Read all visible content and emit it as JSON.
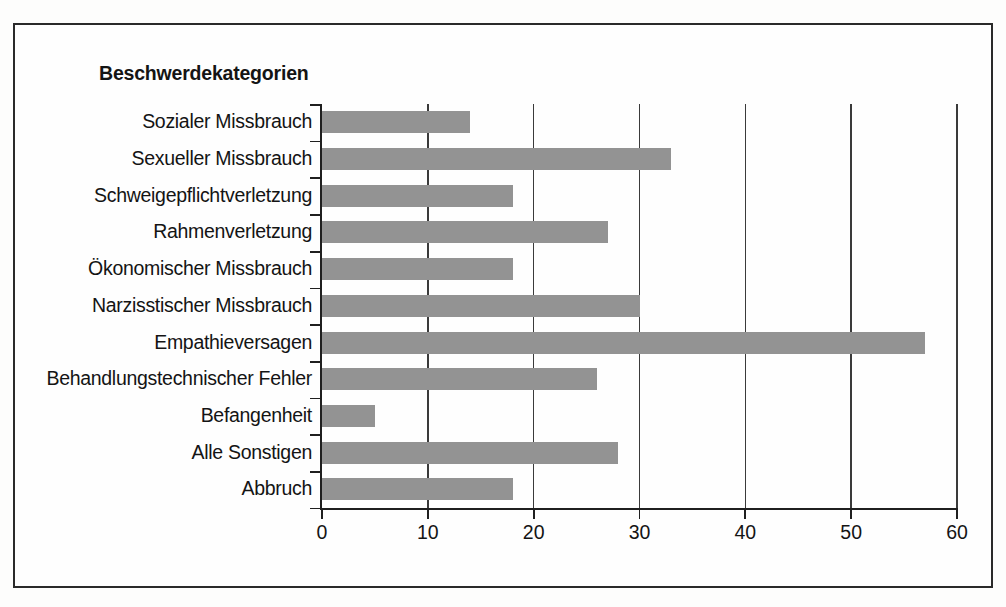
{
  "chart": {
    "title": "Beschwerdekategorien",
    "bar_color": "#939393",
    "frame_color": "#2a2a2a",
    "axis_color": "#1f1f1f"
  },
  "chart_data": {
    "type": "bar",
    "orientation": "horizontal",
    "title": "Beschwerdekategorien",
    "xlabel": "",
    "ylabel": "",
    "xlim": [
      0,
      60
    ],
    "xticks": [
      0,
      10,
      20,
      30,
      40,
      50,
      60
    ],
    "xtick_labels": [
      "0",
      "10",
      "20",
      "30",
      "40",
      "50",
      "60"
    ],
    "grid": true,
    "grid_axis": "x",
    "legend": false,
    "categories": [
      "Sozialer Missbrauch",
      "Sexueller Missbrauch",
      "Schweigepflichtverletzung",
      "Rahmenverletzung",
      "Ökonomischer Missbrauch",
      "Narzisstischer Missbrauch",
      "Empathieversagen",
      "Behandlungstechnischer Fehler",
      "Befangenheit",
      "Alle Sonstigen",
      "Abbruch"
    ],
    "values": [
      14,
      33,
      18,
      27,
      18,
      30,
      57,
      26,
      5,
      28,
      18
    ]
  }
}
